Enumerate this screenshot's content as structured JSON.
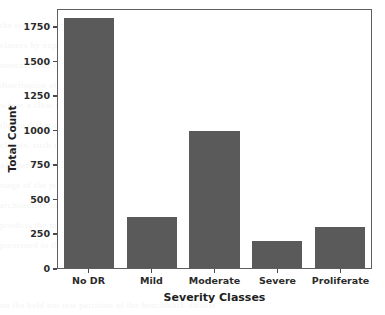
{
  "chart_data": {
    "type": "bar",
    "title": "",
    "subtitle": "",
    "xlabel": "Severity Classes",
    "ylabel": "Total Count",
    "categories": [
      "No DR",
      "Mild",
      "Moderate",
      "Severe",
      "Proliferate"
    ],
    "values": [
      1805,
      370,
      990,
      193,
      295
    ],
    "series": [
      {
        "name": "Total Count",
        "values": [
          1805,
          370,
          990,
          193,
          295
        ]
      }
    ],
    "ylim": [
      0,
      1880
    ],
    "xlim": [
      0,
      5
    ],
    "y_ticks": [
      0,
      250,
      500,
      750,
      1000,
      1250,
      1500,
      1750
    ],
    "y_tick_labels": [
      "0",
      "250",
      "500",
      "750",
      "1000",
      "1250",
      "1500",
      "1750"
    ],
    "x_tick_labels": [
      "No DR",
      "Mild",
      "Moderate",
      "Severe",
      "Proliferate"
    ],
    "grid": false,
    "legend": false,
    "legend_position": "none",
    "bar_color": "#5a5a5a",
    "bar_width_ratio": 0.8,
    "frame": true,
    "background_color": "#ffffff",
    "annotations": []
  },
  "ghost_text": [
    "the retinal fundus images were graded into five severity",
    "classes by expert ophthalmologists following the",
    "international clinical diabetic retinopathy scale. the",
    "distribution of the dataset is shown in the figure below",
    "where a clear class imbalance can be observed between",
    "the no diabetic retinopathy class and the remaining",
    "classes. such imbalance motivates the use of data",
    "augmentation and class weighting during the training",
    "stage of the proposed convolutional neural network",
    "architecture in order to avoid a biased classifier that",
    "predicts the majority class for most of the input samples",
    "presented to the model during inference and evaluation",
    "on the held out test partition of the benchmark dataset"
  ]
}
